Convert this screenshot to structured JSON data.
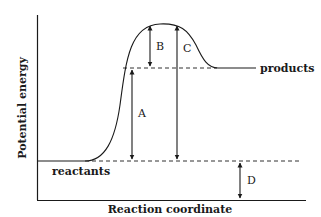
{
  "diagram": {
    "type": "energy-profile",
    "axes": {
      "y_label": "Potential energy",
      "x_label": "Reaction coordinate"
    },
    "levels": {
      "reactants_label": "reactants",
      "products_label": "products"
    },
    "arrows": {
      "A": "A",
      "B": "B",
      "C": "C",
      "D": "D"
    },
    "colors": {
      "line": "#1a1a1a",
      "background": "#ffffff"
    }
  }
}
